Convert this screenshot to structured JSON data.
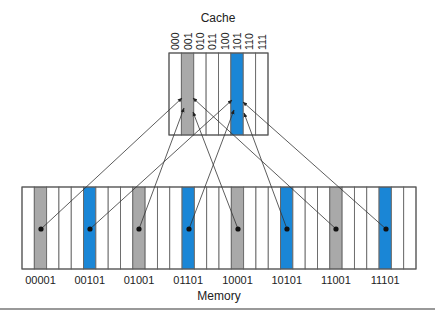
{
  "cache": {
    "title": "Cache",
    "x": 169,
    "y": 53,
    "width": 99,
    "height": 82,
    "slots": [
      "000",
      "001",
      "010",
      "011",
      "100",
      "101",
      "110",
      "111"
    ],
    "highlight": {
      "1": "gray",
      "5": "blue"
    }
  },
  "memory": {
    "title": "Memory",
    "x": 22,
    "y": 187,
    "width": 394,
    "height": 82,
    "cell_count": 32,
    "highlight": {
      "1": "gray",
      "5": "blue",
      "9": "gray",
      "13": "blue",
      "17": "gray",
      "21": "blue",
      "25": "gray",
      "29": "blue"
    },
    "labels": [
      {
        "cell": 1,
        "text": "00001"
      },
      {
        "cell": 5,
        "text": "00101"
      },
      {
        "cell": 9,
        "text": "01001"
      },
      {
        "cell": 13,
        "text": "01101"
      },
      {
        "cell": 17,
        "text": "10001"
      },
      {
        "cell": 21,
        "text": "10101"
      },
      {
        "cell": 25,
        "text": "11001"
      },
      {
        "cell": 29,
        "text": "11101"
      }
    ]
  },
  "mappings": [
    {
      "from": "00001",
      "dot": [
        41,
        229
      ],
      "to": [
        182,
        98
      ],
      "cache_slot": "001"
    },
    {
      "from": "00101",
      "dot": [
        90,
        229
      ],
      "to": [
        232,
        100
      ],
      "cache_slot": "101"
    },
    {
      "from": "01001",
      "dot": [
        139,
        229
      ],
      "to": [
        184,
        108
      ],
      "cache_slot": "001"
    },
    {
      "from": "01101",
      "dot": [
        189,
        229
      ],
      "to": [
        234,
        110
      ],
      "cache_slot": "101"
    },
    {
      "from": "10001",
      "dot": [
        238,
        229
      ],
      "to": [
        193,
        112
      ],
      "cache_slot": "001"
    },
    {
      "from": "10101",
      "dot": [
        287,
        229
      ],
      "to": [
        244,
        113
      ],
      "cache_slot": "101"
    },
    {
      "from": "11001",
      "dot": [
        336,
        229
      ],
      "to": [
        193,
        98
      ],
      "cache_slot": "001"
    },
    {
      "from": "11101",
      "dot": [
        386,
        229
      ],
      "to": [
        243,
        102
      ],
      "cache_slot": "101"
    }
  ],
  "colors": {
    "gray": "#a9a9a9",
    "blue": "#1a86d6"
  }
}
